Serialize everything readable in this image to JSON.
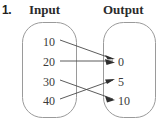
{
  "problem": {
    "number": "1."
  },
  "headers": {
    "input": "Input",
    "output": "Output"
  },
  "colors": {
    "box_stroke": "#9a9a9a",
    "arrow": "#4a4a4a",
    "text": "#3a3a3a",
    "number_label": "#231f20",
    "background": "#ffffff"
  },
  "mapping_diagram": {
    "type": "mapping",
    "inputs": [
      {
        "label": "10",
        "y": 42
      },
      {
        "label": "20",
        "y": 62
      },
      {
        "label": "30",
        "y": 82
      },
      {
        "label": "40",
        "y": 101
      }
    ],
    "outputs": [
      {
        "label": "0",
        "y": 62
      },
      {
        "label": "5",
        "y": 82
      },
      {
        "label": "10",
        "y": 101
      }
    ],
    "arrows": [
      {
        "from": "10",
        "to": "0"
      },
      {
        "from": "20",
        "to": "0"
      },
      {
        "from": "30",
        "to": "10"
      },
      {
        "from": "40",
        "to": "5"
      }
    ]
  }
}
